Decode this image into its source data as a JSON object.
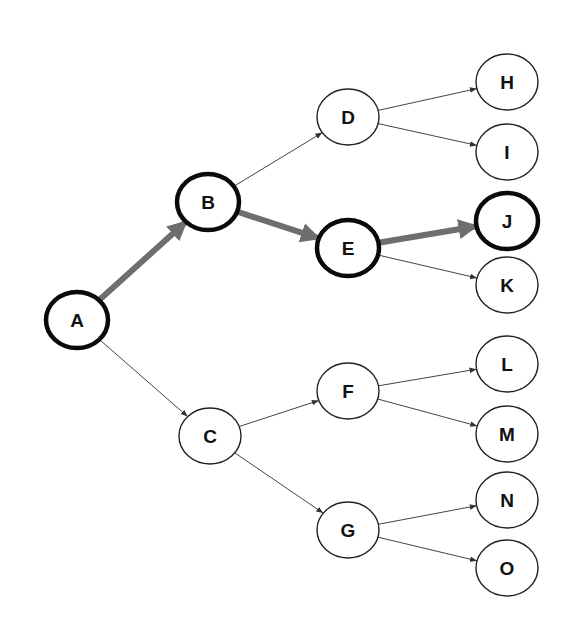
{
  "diagram": {
    "type": "tree",
    "colors": {
      "background": "#ffffff",
      "node_fill": "#ffffff",
      "node_stroke": "#222222",
      "highlight_node_stroke": "#0a0a0a",
      "edge": "#444444",
      "highlight_edge": "#6e6e6e",
      "label": "#111111"
    },
    "nodes": [
      {
        "id": "A",
        "label": "A",
        "x": 77,
        "y": 320,
        "highlighted": true
      },
      {
        "id": "B",
        "label": "B",
        "x": 208,
        "y": 202,
        "highlighted": true
      },
      {
        "id": "C",
        "label": "C",
        "x": 210,
        "y": 436,
        "highlighted": false
      },
      {
        "id": "D",
        "label": "D",
        "x": 348,
        "y": 117,
        "highlighted": false
      },
      {
        "id": "E",
        "label": "E",
        "x": 348,
        "y": 248,
        "highlighted": true
      },
      {
        "id": "F",
        "label": "F",
        "x": 348,
        "y": 391,
        "highlighted": false
      },
      {
        "id": "G",
        "label": "G",
        "x": 348,
        "y": 530,
        "highlighted": false
      },
      {
        "id": "H",
        "label": "H",
        "x": 507,
        "y": 82,
        "highlighted": false
      },
      {
        "id": "I",
        "label": "I",
        "x": 507,
        "y": 152,
        "highlighted": false
      },
      {
        "id": "J",
        "label": "J",
        "x": 507,
        "y": 221,
        "highlighted": true
      },
      {
        "id": "K",
        "label": "K",
        "x": 507,
        "y": 285,
        "highlighted": false
      },
      {
        "id": "L",
        "label": "L",
        "x": 507,
        "y": 364,
        "highlighted": false
      },
      {
        "id": "M",
        "label": "M",
        "x": 507,
        "y": 434,
        "highlighted": false
      },
      {
        "id": "N",
        "label": "N",
        "x": 507,
        "y": 500,
        "highlighted": false
      },
      {
        "id": "O",
        "label": "O",
        "x": 507,
        "y": 568,
        "highlighted": false
      }
    ],
    "edges": [
      {
        "from": "A",
        "to": "B",
        "highlighted": true
      },
      {
        "from": "A",
        "to": "C",
        "highlighted": false
      },
      {
        "from": "B",
        "to": "D",
        "highlighted": false
      },
      {
        "from": "B",
        "to": "E",
        "highlighted": true
      },
      {
        "from": "C",
        "to": "F",
        "highlighted": false
      },
      {
        "from": "C",
        "to": "G",
        "highlighted": false
      },
      {
        "from": "D",
        "to": "H",
        "highlighted": false
      },
      {
        "from": "D",
        "to": "I",
        "highlighted": false
      },
      {
        "from": "E",
        "to": "J",
        "highlighted": true
      },
      {
        "from": "E",
        "to": "K",
        "highlighted": false
      },
      {
        "from": "F",
        "to": "L",
        "highlighted": false
      },
      {
        "from": "F",
        "to": "M",
        "highlighted": false
      },
      {
        "from": "G",
        "to": "N",
        "highlighted": false
      },
      {
        "from": "G",
        "to": "O",
        "highlighted": false
      }
    ],
    "highlighted_path": [
      "A",
      "B",
      "E",
      "J"
    ]
  }
}
